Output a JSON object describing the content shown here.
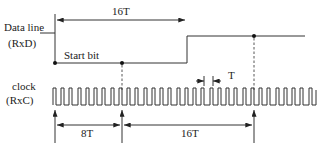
{
  "diagram": {
    "type": "timing-diagram",
    "signals": [
      {
        "name": "Data line",
        "sub": "(RxD)"
      },
      {
        "name": "clock",
        "sub": "(RxC)"
      }
    ],
    "labels": {
      "start_bit": "Start bit",
      "top_interval": "16T",
      "bottom_interval_1": "8T",
      "bottom_interval_2": "16T",
      "period": "T"
    },
    "clock_cycles": 32,
    "colors": {
      "stroke": "#333333",
      "background": "#ffffff"
    }
  }
}
